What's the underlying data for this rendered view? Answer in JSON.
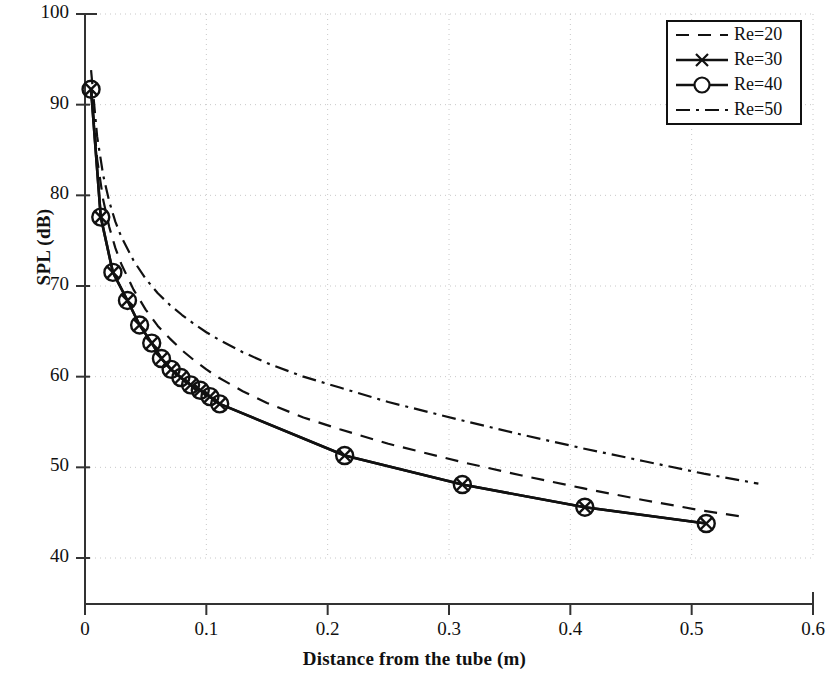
{
  "chart_data": {
    "type": "line",
    "title": "",
    "xlabel": "Distance from the tube (m)",
    "ylabel": "SPL (dB)",
    "xlim": [
      0,
      0.6
    ],
    "ylim": [
      40,
      100
    ],
    "xticks": [
      "0",
      "0.1",
      "0.2",
      "0.3",
      "0.4",
      "0.5",
      "0.6"
    ],
    "xtick_values": [
      0,
      0.1,
      0.2,
      0.3,
      0.4,
      0.5,
      0.6
    ],
    "yticks": [
      "40",
      "50",
      "60",
      "70",
      "80",
      "90",
      "100"
    ],
    "ytick_values": [
      40,
      50,
      60,
      70,
      80,
      90,
      100
    ],
    "grid": true,
    "grid_style": "dotted",
    "grid_color": "#c8c8c8",
    "legend_position": "top-right",
    "line_color": "#111111",
    "series": [
      {
        "name": "Re=20",
        "style": "dashed",
        "marker": "none",
        "x": [
          0.005,
          0.01,
          0.015,
          0.02,
          0.025,
          0.03,
          0.04,
          0.05,
          0.06,
          0.07,
          0.08,
          0.09,
          0.1,
          0.11,
          0.13,
          0.15,
          0.18,
          0.21,
          0.25,
          0.31,
          0.36,
          0.41,
          0.46,
          0.51,
          0.545
        ],
        "y": [
          91.7,
          84.0,
          79.5,
          76.5,
          74.2,
          72.4,
          69.6,
          67.4,
          65.6,
          64.2,
          62.9,
          61.8,
          60.8,
          59.9,
          58.4,
          57.1,
          55.5,
          54.2,
          52.6,
          50.6,
          49.1,
          47.7,
          46.4,
          45.2,
          44.5
        ]
      },
      {
        "name": "Re=30",
        "style": "solid",
        "marker": "x",
        "x": [
          0.005,
          0.013,
          0.023,
          0.035,
          0.045,
          0.055,
          0.063,
          0.071,
          0.079,
          0.087,
          0.095,
          0.103,
          0.111,
          0.214,
          0.311,
          0.412,
          0.512
        ],
        "y": [
          91.7,
          77.6,
          71.5,
          68.4,
          65.7,
          63.7,
          62.0,
          60.8,
          59.9,
          59.1,
          58.5,
          57.8,
          57.0,
          51.3,
          48.1,
          45.6,
          43.8
        ]
      },
      {
        "name": "Re=40",
        "style": "solid",
        "marker": "o",
        "x": [
          0.005,
          0.013,
          0.023,
          0.035,
          0.045,
          0.055,
          0.063,
          0.071,
          0.079,
          0.087,
          0.095,
          0.103,
          0.111,
          0.214,
          0.311,
          0.412,
          0.512
        ],
        "y": [
          91.7,
          77.6,
          71.5,
          68.4,
          65.7,
          63.7,
          62.0,
          60.8,
          59.9,
          59.1,
          58.5,
          57.8,
          57.0,
          51.3,
          48.1,
          45.6,
          43.8
        ]
      },
      {
        "name": "Re=50",
        "style": "dashdot",
        "marker": "none",
        "x": [
          0.005,
          0.01,
          0.015,
          0.02,
          0.025,
          0.03,
          0.04,
          0.05,
          0.06,
          0.07,
          0.08,
          0.09,
          0.1,
          0.11,
          0.13,
          0.15,
          0.18,
          0.21,
          0.25,
          0.31,
          0.36,
          0.41,
          0.46,
          0.51,
          0.555
        ],
        "y": [
          93.8,
          86.5,
          82.2,
          79.3,
          77.1,
          75.4,
          72.8,
          70.8,
          69.2,
          67.9,
          66.8,
          65.8,
          64.9,
          64.1,
          62.7,
          61.5,
          60.0,
          58.8,
          57.2,
          55.2,
          53.6,
          52.1,
          50.7,
          49.3,
          48.2
        ]
      }
    ],
    "legend": [
      {
        "label": "Re=20",
        "style": "dashed",
        "marker": "none"
      },
      {
        "label": "Re=30",
        "style": "solid",
        "marker": "x"
      },
      {
        "label": "Re=40",
        "style": "solid",
        "marker": "o"
      },
      {
        "label": "Re=50",
        "style": "dashdot",
        "marker": "none"
      }
    ]
  },
  "axes_geometry": {
    "left_px": 85,
    "right_px": 813,
    "top_px": 14,
    "bottom_px": 558,
    "baseline_px": 604
  }
}
